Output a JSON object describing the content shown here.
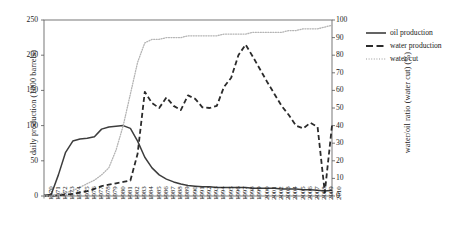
{
  "chart_data": {
    "type": "line",
    "title": "",
    "xlabel": "",
    "ylabel": "daily production (1000 barrels)",
    "y2label": "water/oil ratio (water cut) (%)",
    "xlim": [
      1970,
      2010
    ],
    "ylim": [
      0,
      250
    ],
    "y2lim": [
      0,
      100
    ],
    "yticks": [
      0,
      50,
      100,
      150,
      200,
      250
    ],
    "y2ticks": [
      0,
      10,
      20,
      30,
      40,
      50,
      60,
      70,
      80,
      90,
      100
    ],
    "grid": false,
    "legend_position": "right-outside",
    "x": [
      1970,
      1971,
      1972,
      1973,
      1974,
      1975,
      1976,
      1977,
      1978,
      1979,
      1980,
      1981,
      1982,
      1983,
      1984,
      1985,
      1986,
      1987,
      1988,
      1989,
      1990,
      1991,
      1992,
      1993,
      1994,
      1995,
      1996,
      1997,
      1998,
      1999,
      2000,
      2001,
      2002,
      2003,
      2004,
      2005,
      2006,
      2007,
      2008,
      2009,
      2010
    ],
    "categories": [
      "1970",
      "1971",
      "1972",
      "1973",
      "1974",
      "1975",
      "1976",
      "1977",
      "1978",
      "1979",
      "1980",
      "1981",
      "1982",
      "1983",
      "1984",
      "1985",
      "1986",
      "1987",
      "1988",
      "1989",
      "1990",
      "1991",
      "1992",
      "1993",
      "1994",
      "1995",
      "1996",
      "1997",
      "1998",
      "1999",
      "2000",
      "2001",
      "2002",
      "2003",
      "2004",
      "2005",
      "2006",
      "2007",
      "2008",
      "2009",
      "2010"
    ],
    "series": [
      {
        "name": "oil production",
        "axis": "left",
        "style": "solid",
        "color": "#3d3d3d",
        "units": "1000 barrels/day",
        "values": [
          1,
          2,
          30,
          62,
          78,
          81,
          82,
          84,
          95,
          98,
          99,
          100,
          96,
          78,
          55,
          40,
          30,
          24,
          20,
          17,
          15,
          14,
          13,
          13,
          12,
          12,
          12,
          12,
          12,
          11,
          11,
          11,
          11,
          10,
          10,
          10,
          9,
          9,
          8,
          7,
          8
        ]
      },
      {
        "name": "water production",
        "axis": "left",
        "style": "dashed",
        "color": "#2b2b2b",
        "units": "1000 barrels/day",
        "values": [
          0,
          0,
          1,
          2,
          3,
          5,
          7,
          10,
          14,
          16,
          18,
          20,
          22,
          60,
          148,
          132,
          125,
          140,
          128,
          122,
          143,
          138,
          126,
          125,
          128,
          155,
          168,
          200,
          215,
          198,
          180,
          162,
          145,
          128,
          115,
          100,
          96,
          104,
          98,
          5,
          100
        ]
      },
      {
        "name": "water cut",
        "axis": "right",
        "style": "dotted",
        "color": "#b4b4b4",
        "units": "%",
        "values": [
          0,
          0,
          1,
          2,
          3,
          5,
          7,
          9,
          12,
          16,
          26,
          40,
          58,
          76,
          87,
          89,
          89,
          90,
          90,
          90,
          91,
          91,
          91,
          91,
          91,
          92,
          92,
          92,
          92,
          93,
          93,
          93,
          93,
          93,
          94,
          94,
          95,
          95,
          95,
          96,
          97
        ]
      }
    ]
  },
  "legend": {
    "items": [
      {
        "label": "oil production",
        "style": "solid"
      },
      {
        "label": "water production",
        "style": "dashed"
      },
      {
        "label": "water cut",
        "style": "dotted"
      }
    ]
  }
}
